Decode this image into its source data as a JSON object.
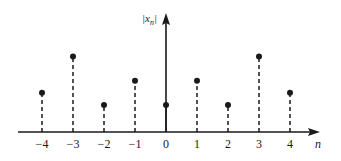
{
  "chart_data": {
    "type": "stem",
    "title": "",
    "xlabel": "n",
    "ylabel": "|x_n|",
    "x": [
      -4,
      -3,
      -2,
      -1,
      0,
      1,
      2,
      3,
      4
    ],
    "categories": [
      "−4",
      "−3",
      "−2",
      "−1",
      "0",
      "1",
      "2",
      "3",
      "4"
    ],
    "values": [
      1.45,
      2.8,
      1.0,
      1.9,
      1.0,
      1.9,
      1.0,
      2.8,
      1.45
    ],
    "stem_style": "dashed",
    "marker": "filled-circle",
    "grid": false,
    "legend": null,
    "ylim": [
      0,
      4.3
    ]
  },
  "axis": {
    "y_label_main": "|x",
    "y_label_sub": "n",
    "y_label_close": "|",
    "x_label": "n"
  }
}
